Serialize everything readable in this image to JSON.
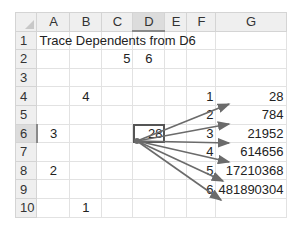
{
  "sheet": {
    "columns": [
      "A",
      "B",
      "C",
      "D",
      "E",
      "F",
      "G"
    ],
    "selected_column": "D",
    "rows": [
      "1",
      "2",
      "3",
      "4",
      "5",
      "6",
      "7",
      "8",
      "9",
      "10"
    ],
    "selected_row": "6",
    "title": "Trace Dependents from D6",
    "cells": {
      "C2": "5",
      "D2": "6",
      "B4": "4",
      "A6": "3",
      "D6": "28",
      "A8": "2",
      "B10": "1",
      "F4": "1",
      "G4": "28",
      "F5": "2",
      "G5": "784",
      "F6": "3",
      "G6": "21952",
      "F7": "4",
      "G7": "614656",
      "F8": "5",
      "G8": "17210368",
      "F9": "6",
      "G9": "481890304"
    },
    "active_cell": "D6",
    "arrow_color": "#6b6b6b",
    "trace_arrows_from": "D6",
    "trace_arrows_to": [
      "F4",
      "F5",
      "F6",
      "F7",
      "F8",
      "F9"
    ]
  }
}
